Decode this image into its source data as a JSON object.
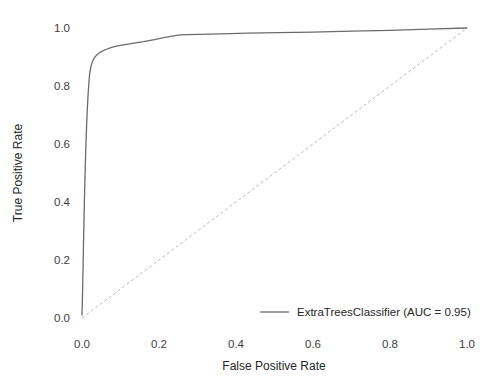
{
  "chart_data": {
    "type": "line",
    "title": "",
    "xlabel": "False Positive Rate",
    "ylabel": "True Positive Rate",
    "xlim": [
      0.0,
      1.0
    ],
    "ylim": [
      0.0,
      1.0
    ],
    "xticks": [
      "0.0",
      "0.2",
      "0.4",
      "0.6",
      "0.8",
      "1.0"
    ],
    "yticks": [
      "0.0",
      "0.2",
      "0.4",
      "0.6",
      "0.8",
      "1.0"
    ],
    "xtick_values": [
      0.0,
      0.2,
      0.4,
      0.6,
      0.8,
      1.0
    ],
    "ytick_values": [
      0.0,
      0.2,
      0.4,
      0.6,
      0.8,
      1.0
    ],
    "grid": false,
    "legend_position": "lower right",
    "series": [
      {
        "name": "ExtraTreesClassifier (AUC = 0.95)",
        "auc": 0.95,
        "color": "#6b6b6b",
        "linestyle": "solid",
        "linewidth": 1.3,
        "x": [
          0.0,
          0.002,
          0.004,
          0.006,
          0.008,
          0.01,
          0.012,
          0.014,
          0.016,
          0.018,
          0.02,
          0.024,
          0.03,
          0.038,
          0.048,
          0.06,
          0.075,
          0.092,
          0.112,
          0.135,
          0.16,
          0.188,
          0.215,
          0.242,
          0.255,
          0.3,
          0.36,
          0.43,
          0.51,
          0.6,
          0.7,
          0.8,
          0.9,
          1.0
        ],
        "y": [
          0.01,
          0.12,
          0.26,
          0.39,
          0.5,
          0.59,
          0.665,
          0.725,
          0.775,
          0.812,
          0.845,
          0.872,
          0.893,
          0.907,
          0.917,
          0.925,
          0.932,
          0.938,
          0.943,
          0.948,
          0.953,
          0.96,
          0.968,
          0.974,
          0.976,
          0.978,
          0.98,
          0.982,
          0.984,
          0.986,
          0.989,
          0.992,
          0.996,
          1.0
        ]
      },
      {
        "name": "chance-diagonal",
        "color": "#b9b9b9",
        "linestyle": "dashed",
        "linewidth": 1.0,
        "x": [
          0.0,
          1.0
        ],
        "y": [
          0.0,
          1.0
        ]
      }
    ],
    "legend": [
      {
        "label": "ExtraTreesClassifier (AUC = 0.95)",
        "color": "#6b6b6b",
        "linestyle": "solid"
      }
    ]
  }
}
